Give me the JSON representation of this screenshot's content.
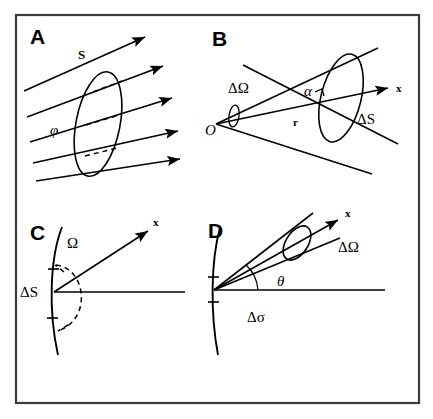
{
  "figure": {
    "background_color": "#ffffff",
    "line_color": "#000000",
    "frame_color": "#3b3b3b",
    "width": 433,
    "height": 419
  },
  "panels": [
    {
      "id": "A",
      "letter": "A",
      "description": "Parallel ray bundle crossing a tilted circular surface",
      "labels": [
        {
          "name": "surface-s",
          "text": "S",
          "x": 78,
          "y": 59,
          "style": "serif-bold-small"
        },
        {
          "name": "angle-phi",
          "text": "φ",
          "x": 50,
          "y": 135,
          "style": "italic"
        }
      ],
      "ray_count": 5
    },
    {
      "id": "B",
      "letter": "B",
      "description": "Cone of rays from origin O subtending solid angle onto tilted area element",
      "labels": [
        {
          "name": "solid-angle-delta-omega",
          "text": "ΔΩ",
          "x": 228,
          "y": 93,
          "style": "upright"
        },
        {
          "name": "origin-o",
          "text": "O",
          "x": 205,
          "y": 135,
          "style": "italic"
        },
        {
          "name": "angle-alpha",
          "text": "α",
          "x": 304,
          "y": 96,
          "style": "italic"
        },
        {
          "name": "radius-r",
          "text": "r",
          "x": 293,
          "y": 126,
          "style": "serif-bold-small"
        },
        {
          "name": "area-delta-s",
          "text": "ΔS",
          "x": 357,
          "y": 124,
          "style": "upright"
        },
        {
          "name": "axis-x",
          "text": "x",
          "x": 396,
          "y": 92,
          "style": "serif-bold-small"
        }
      ]
    },
    {
      "id": "C",
      "letter": "C",
      "description": "Surface element on a curved boundary with full hemisphere of directions",
      "labels": [
        {
          "name": "solid-angle-omega",
          "text": "Ω",
          "x": 67,
          "y": 248,
          "style": "upright"
        },
        {
          "name": "area-delta-s",
          "text": "ΔS",
          "x": 22,
          "y": 294,
          "style": "upright"
        },
        {
          "name": "axis-x",
          "text": "x",
          "x": 155,
          "y": 224,
          "style": "serif-bold-small"
        }
      ]
    },
    {
      "id": "D",
      "letter": "D",
      "description": "Surface element on curved boundary with narrow cone at angle theta to the normal",
      "labels": [
        {
          "name": "angle-theta",
          "text": "θ",
          "x": 283,
          "y": 282,
          "style": "italic"
        },
        {
          "name": "area-delta-sigma",
          "text": "Δσ",
          "x": 253,
          "y": 320,
          "style": "upright"
        },
        {
          "name": "solid-angle-delta-omega",
          "text": "ΔΩ",
          "x": 342,
          "y": 250,
          "style": "upright"
        },
        {
          "name": "axis-x",
          "text": "x",
          "x": 348,
          "y": 216,
          "style": "serif-bold-small"
        }
      ]
    }
  ]
}
